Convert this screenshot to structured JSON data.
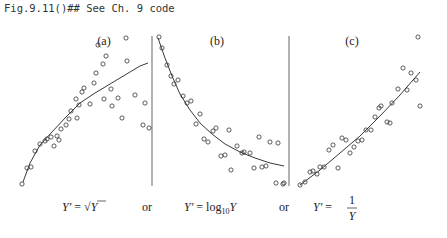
{
  "header": {
    "code": "Fig.9.11()## See Ch. 9 code"
  },
  "colors": {
    "points": "#333333",
    "curve": "#222222",
    "divider": "#888888"
  },
  "panels": [
    {
      "label": "(a)",
      "label_pos": [
        104,
        45
      ],
      "points": [
        [
          22,
          184
        ],
        [
          27,
          168
        ],
        [
          31,
          167
        ],
        [
          35,
          151
        ],
        [
          40,
          144
        ],
        [
          45,
          141
        ],
        [
          47,
          139
        ],
        [
          51,
          137
        ],
        [
          54,
          146
        ],
        [
          57,
          136
        ],
        [
          61,
          129
        ],
        [
          59,
          140
        ],
        [
          66,
          125
        ],
        [
          69,
          119
        ],
        [
          71,
          111
        ],
        [
          76,
          99
        ],
        [
          79,
          105
        ],
        [
          77,
          118
        ],
        [
          82,
          92
        ],
        [
          84,
          88
        ],
        [
          90,
          104
        ],
        [
          94,
          83
        ],
        [
          96,
          73
        ],
        [
          98,
          45
        ],
        [
          103,
          64
        ],
        [
          104,
          99
        ],
        [
          106,
          56
        ],
        [
          111,
          89
        ],
        [
          112,
          106
        ],
        [
          118,
          98
        ],
        [
          122,
          118
        ],
        [
          126,
          38
        ],
        [
          127,
          61
        ],
        [
          135,
          95
        ],
        [
          143,
          125
        ],
        [
          149,
          128
        ],
        [
          145,
          103
        ]
      ],
      "curve": [
        [
          23,
          182
        ],
        [
          30,
          163
        ],
        [
          40,
          145
        ],
        [
          52,
          132
        ],
        [
          65,
          118
        ],
        [
          80,
          103
        ],
        [
          95,
          93
        ],
        [
          110,
          84
        ],
        [
          125,
          75
        ],
        [
          140,
          66
        ],
        [
          148,
          63
        ]
      ],
      "formula": {
        "lhs": "Y′ = ",
        "rhs": "√Y",
        "x": 62,
        "y": 211
      }
    },
    {
      "label": "(b)",
      "label_pos": [
        217,
        45
      ],
      "points": [
        [
          159,
          37
        ],
        [
          162,
          48
        ],
        [
          167,
          65
        ],
        [
          171,
          76
        ],
        [
          174,
          84
        ],
        [
          178,
          80
        ],
        [
          183,
          96
        ],
        [
          187,
          103
        ],
        [
          191,
          101
        ],
        [
          200,
          114
        ],
        [
          196,
          124
        ],
        [
          204,
          139
        ],
        [
          208,
          142
        ],
        [
          213,
          131
        ],
        [
          216,
          128
        ],
        [
          229,
          130
        ],
        [
          221,
          156
        ],
        [
          225,
          155
        ],
        [
          231,
          170
        ],
        [
          237,
          146
        ],
        [
          242,
          153
        ],
        [
          244,
          152
        ],
        [
          250,
          153
        ],
        [
          254,
          168
        ],
        [
          259,
          137
        ],
        [
          262,
          167
        ],
        [
          266,
          166
        ],
        [
          270,
          142
        ],
        [
          278,
          143
        ],
        [
          276,
          183
        ],
        [
          283,
          184
        ],
        [
          284,
          183
        ]
      ],
      "curve": [
        [
          158,
          38
        ],
        [
          165,
          58
        ],
        [
          172,
          76
        ],
        [
          180,
          94
        ],
        [
          190,
          110
        ],
        [
          200,
          123
        ],
        [
          212,
          134
        ],
        [
          225,
          144
        ],
        [
          240,
          152
        ],
        [
          255,
          158
        ],
        [
          270,
          163
        ],
        [
          284,
          166
        ]
      ],
      "formula": {
        "lhs": "Y′ = log",
        "sub": "10",
        "rhs": "Y",
        "x": 184,
        "y": 211
      }
    },
    {
      "label": "(c)",
      "label_pos": [
        352,
        45
      ],
      "points": [
        [
          300,
          185
        ],
        [
          305,
          182
        ],
        [
          310,
          172
        ],
        [
          313,
          171
        ],
        [
          317,
          174
        ],
        [
          320,
          167
        ],
        [
          324,
          167
        ],
        [
          338,
          168
        ],
        [
          329,
          150
        ],
        [
          333,
          145
        ],
        [
          342,
          138
        ],
        [
          346,
          140
        ],
        [
          350,
          153
        ],
        [
          354,
          147
        ],
        [
          358,
          141
        ],
        [
          362,
          140
        ],
        [
          366,
          130
        ],
        [
          371,
          130
        ],
        [
          375,
          117
        ],
        [
          379,
          108
        ],
        [
          381,
          106
        ],
        [
          387,
          122
        ],
        [
          390,
          123
        ],
        [
          392,
          103
        ],
        [
          398,
          89
        ],
        [
          403,
          68
        ],
        [
          407,
          90
        ],
        [
          411,
          73
        ],
        [
          416,
          80
        ],
        [
          418,
          37
        ],
        [
          420,
          106
        ]
      ],
      "curve": [
        [
          300,
          185
        ],
        [
          320,
          170
        ],
        [
          340,
          153
        ],
        [
          360,
          136
        ],
        [
          380,
          116
        ],
        [
          400,
          95
        ],
        [
          420,
          72
        ]
      ],
      "formula": {
        "lhs": "Y′ = ",
        "num": "1",
        "den": "Y",
        "x": 313,
        "y": 211
      }
    }
  ],
  "dividers": [
    {
      "x": 152,
      "y1": 36,
      "y2": 186
    },
    {
      "x": 289,
      "y1": 36,
      "y2": 186
    }
  ],
  "connectors": [
    {
      "text": "or",
      "x": 147,
      "y": 211
    },
    {
      "text": "or",
      "x": 284,
      "y": 211
    }
  ]
}
